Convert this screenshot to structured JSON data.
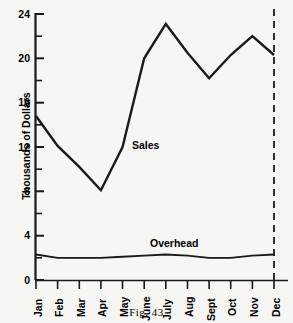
{
  "figure": {
    "caption": "Fig. 43",
    "background_color": "#f6f6f4",
    "line_color": "#1a1a1a"
  },
  "chart_data": {
    "type": "line",
    "title": "",
    "subtitle": "",
    "xlabel": "",
    "ylabel": "Thousands of Dollars",
    "categories": [
      "Jan",
      "Feb",
      "Mar",
      "Apr",
      "May",
      "June",
      "July",
      "Aug",
      "Sept",
      "Oct",
      "Nov",
      "Dec"
    ],
    "series": [
      {
        "name": "Sales",
        "values": [
          14.8,
          12.1,
          10.2,
          8.1,
          12.0,
          20.0,
          23.1,
          20.5,
          18.2,
          20.3,
          22.0,
          20.3
        ],
        "label_text": "Sales",
        "color": "#1a1a1a"
      },
      {
        "name": "Overhead",
        "values": [
          2.3,
          2.0,
          2.0,
          2.0,
          2.1,
          2.2,
          2.3,
          2.2,
          2.0,
          2.0,
          2.2,
          2.3
        ],
        "label_text": "Overhead",
        "color": "#1a1a1a"
      }
    ],
    "ylim": [
      0,
      24
    ],
    "xlim": [
      0,
      11
    ],
    "ytick_labels": [
      "0",
      "4",
      "8",
      "12",
      "16",
      "20",
      "24"
    ],
    "ytick_values": [
      0,
      4,
      8,
      12,
      16,
      20,
      24
    ],
    "yminor_tick_values": [
      2,
      6,
      10,
      14,
      18,
      22
    ],
    "grid": false,
    "legend_position": "inline-annotations",
    "annotations": [
      {
        "text": "Sales",
        "x_category": "May",
        "y_value": 12.7
      },
      {
        "text": "Overhead",
        "x_category": "July",
        "y_value": 3.8
      }
    ],
    "reference_lines": [
      {
        "orientation": "vertical",
        "at_category": "Dec",
        "style": "dashed"
      }
    ]
  },
  "labels": {
    "y0": "0",
    "y4": "4",
    "y8": "8",
    "y12": "12",
    "y16": "16",
    "y20": "20",
    "y24": "24",
    "x0": "Jan",
    "x1": "Feb",
    "x2": "Mar",
    "x3": "Apr",
    "x4": "May",
    "x5": "June",
    "x6": "July",
    "x7": "Aug",
    "x8": "Sept",
    "x9": "Oct",
    "x10": "Nov",
    "x11": "Dec"
  }
}
